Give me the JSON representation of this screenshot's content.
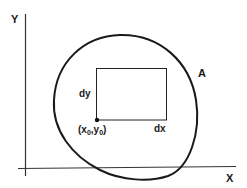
{
  "diagram": {
    "axes": {
      "x_label": "X",
      "y_label": "Y"
    },
    "region": {
      "label": "A"
    },
    "element": {
      "width_label": "dx",
      "height_label": "dy",
      "origin_label_prefix": "(x",
      "origin_sub_1": "0",
      "origin_mid": ",y",
      "origin_sub_2": "0",
      "origin_label_suffix": ")",
      "origin_label_full": "(x0,y0)"
    },
    "colors": {
      "stroke": "#1a1a1a",
      "axis": "#333333",
      "background": "#ffffff"
    }
  }
}
